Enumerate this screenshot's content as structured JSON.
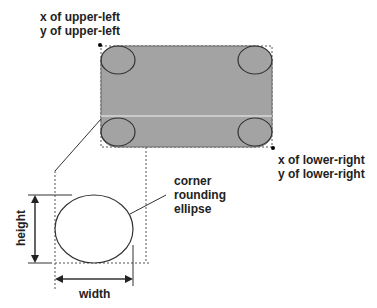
{
  "diagram": {
    "labels": {
      "upper_left": [
        "x of upper-left",
        "y of upper-left"
      ],
      "lower_right": [
        "x of lower-right",
        "y of lower-right"
      ],
      "ellipse": [
        "corner",
        "rounding",
        "ellipse"
      ],
      "height": "height",
      "width": "width"
    },
    "colors": {
      "rect_fill": "#a3a3a3",
      "rect_stroke": "#555555",
      "ellipse_stroke": "#333333",
      "highlight_line": "#d8d8d8",
      "text": "#222222"
    }
  }
}
